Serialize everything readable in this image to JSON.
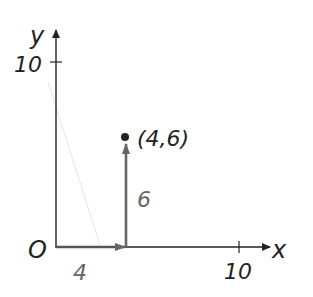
{
  "diagram": {
    "axes": {
      "x_label": "x",
      "y_label": "y",
      "origin_label": "O",
      "x_tick_label": "10",
      "y_tick_label": "10"
    },
    "point": {
      "label": "(4,6)",
      "x": 4,
      "y": 6
    },
    "components": {
      "horizontal_label": "4",
      "vertical_label": "6"
    },
    "colors": {
      "axis": "#222222",
      "component": "#666666",
      "label_gray": "#666666"
    }
  }
}
